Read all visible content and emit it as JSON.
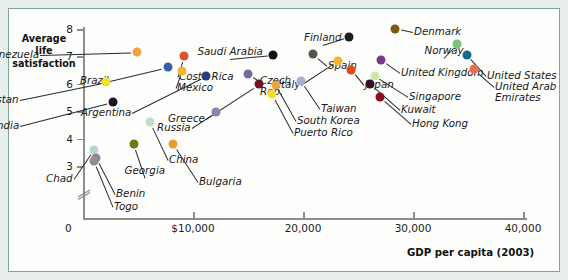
{
  "chart_data": {
    "type": "scatter",
    "title": "",
    "xlabel": "GDP per capita (2003)",
    "ylabel": "Average life satisfaction",
    "ylabel_lines": [
      "Average",
      "life",
      "satisfaction"
    ],
    "xlim": [
      0,
      45000
    ],
    "ylim": [
      2.6,
      8.3
    ],
    "grid": false,
    "legend": "none",
    "y_axis_break": true,
    "y_ticks": [
      {
        "value": 8,
        "label": "8"
      },
      {
        "value": 7,
        "label": "7"
      },
      {
        "value": 6,
        "label": "6"
      },
      {
        "value": 5,
        "label": "5"
      },
      {
        "value": 4,
        "label": "4"
      },
      {
        "value": 3,
        "label": "3"
      }
    ],
    "origin_label": "0",
    "x_ticks": [
      {
        "value": 10000,
        "label": "$10,000"
      },
      {
        "value": 20000,
        "label": "20,000"
      },
      {
        "value": 30000,
        "label": "30,000"
      },
      {
        "value": 40000,
        "label": "40,000"
      }
    ],
    "points": [
      {
        "name": "Venezuela",
        "x": 4900,
        "y": 7.15,
        "color": "#eda43c",
        "label": "Venezuela",
        "lx": 30,
        "ly": 40,
        "anchor": "end"
      },
      {
        "name": "Costa Rica",
        "x": 9200,
        "y": 7.0,
        "color": "#e0502a",
        "label": "Costa Rica",
        "lx": 170,
        "ly": 62,
        "anchor": "start"
      },
      {
        "name": "Brazil",
        "x": 7700,
        "y": 6.6,
        "color": "#3a5fa8",
        "label": "Brazil",
        "lx": 100,
        "ly": 66,
        "anchor": "end"
      },
      {
        "name": "Mexico",
        "x": 9000,
        "y": 6.47,
        "color": "#f0b62e",
        "label": "Mexico",
        "lx": 168,
        "ly": 73,
        "anchor": "start"
      },
      {
        "name": "Pakistan",
        "x": 2100,
        "y": 6.05,
        "color": "#f3dd2e",
        "label": "Pakistan",
        "lx": 10,
        "ly": 85,
        "anchor": "end"
      },
      {
        "name": "Argentina",
        "x": 11200,
        "y": 6.28,
        "color": "#2b3f7a",
        "label": "Argentina",
        "lx": 122,
        "ly": 98,
        "anchor": "end"
      },
      {
        "name": "India",
        "x": 2700,
        "y": 5.33,
        "color": "#241226",
        "label": "India",
        "lx": 10,
        "ly": 111,
        "anchor": "end"
      },
      {
        "name": "Saudi Arabia",
        "x": 17300,
        "y": 7.05,
        "color": "#111111",
        "label": "Saudi Arabia",
        "lx": 221,
        "ly": 37,
        "anchor": "center"
      },
      {
        "name": "Czech Rep.",
        "x": 15000,
        "y": 6.37,
        "color": "#6e6fa0",
        "label": "Czech\nRep.",
        "lx": 251,
        "ly": 66,
        "anchor": "start"
      },
      {
        "name": "Greece",
        "x": 16000,
        "y": 5.98,
        "color": "#70131f",
        "label": "Greece",
        "lx": 196,
        "ly": 104,
        "anchor": "end"
      },
      {
        "name": "Russia",
        "x": 12100,
        "y": 4.96,
        "color": "#8f82a5",
        "label": "Russia",
        "lx": 182,
        "ly": 113,
        "anchor": "end"
      },
      {
        "name": "Finland",
        "x": 24200,
        "y": 7.72,
        "color": "#1c1c1c",
        "label": "Finland",
        "lx": 314,
        "ly": 23,
        "anchor": "center"
      },
      {
        "name": "Denmark",
        "x": 28400,
        "y": 8.02,
        "color": "#7d5a11",
        "label": "Denmark",
        "lx": 405,
        "ly": 17,
        "anchor": "start"
      },
      {
        "name": "Spain",
        "x": 20900,
        "y": 7.08,
        "color": "#555550",
        "label": "Spain",
        "lx": 319,
        "ly": 51,
        "anchor": "start"
      },
      {
        "name": "Italy",
        "x": 23200,
        "y": 6.85,
        "color": "#f0b62e",
        "label": "Italy",
        "lx": 291,
        "ly": 70,
        "anchor": "end"
      },
      {
        "name": "Japan",
        "x": 24400,
        "y": 6.52,
        "color": "#e2481d",
        "label": "Japan",
        "lx": 356,
        "ly": 70,
        "anchor": "start"
      },
      {
        "name": "United Kingdom",
        "x": 27100,
        "y": 6.88,
        "color": "#7a3a8c",
        "label": "United Kingdom",
        "lx": 392,
        "ly": 58,
        "anchor": "start"
      },
      {
        "name": "Norway",
        "x": 34000,
        "y": 7.45,
        "color": "#7cc47d",
        "label": "Norway",
        "lx": 435,
        "ly": 36,
        "anchor": "center"
      },
      {
        "name": "United States",
        "x": 34900,
        "y": 7.06,
        "color": "#166b87",
        "label": "United States",
        "lx": 478,
        "ly": 61,
        "anchor": "start"
      },
      {
        "name": "United Arab Emirates",
        "x": 35500,
        "y": 6.54,
        "color": "#ea6e47",
        "label": "United Arab\nEmirates",
        "lx": 486,
        "ly": 72,
        "anchor": "start"
      },
      {
        "name": "Singapore",
        "x": 26500,
        "y": 6.3,
        "color": "#cfe6a8",
        "label": "Singapore",
        "lx": 400,
        "ly": 82,
        "anchor": "start"
      },
      {
        "name": "Kuwait",
        "x": 26100,
        "y": 6.0,
        "color": "#32102f",
        "label": "Kuwait",
        "lx": 392,
        "ly": 95,
        "anchor": "start"
      },
      {
        "name": "Hong Kong",
        "x": 27000,
        "y": 5.52,
        "color": "#8c1020",
        "label": "Hong Kong",
        "lx": 403,
        "ly": 109,
        "anchor": "start"
      },
      {
        "name": "Taiwan",
        "x": 19800,
        "y": 6.12,
        "color": "#b0aad0",
        "label": "Taiwan",
        "lx": 312,
        "ly": 94,
        "anchor": "start"
      },
      {
        "name": "South Korea",
        "x": 17500,
        "y": 5.96,
        "color": "#eda43c",
        "label": "South Korea",
        "lx": 288,
        "ly": 106,
        "anchor": "start"
      },
      {
        "name": "Puerto Rico",
        "x": 17200,
        "y": 5.62,
        "color": "#f3dd2e",
        "label": "Puerto Rico",
        "lx": 285,
        "ly": 118,
        "anchor": "start"
      },
      {
        "name": "China",
        "x": 6100,
        "y": 4.6,
        "color": "#c3dcc6",
        "label": "China",
        "lx": 160,
        "ly": 145,
        "anchor": "start"
      },
      {
        "name": "Georgia",
        "x": 4600,
        "y": 3.8,
        "color": "#697a15",
        "label": "Georgia",
        "lx": 136,
        "ly": 156,
        "anchor": "center"
      },
      {
        "name": "Bulgaria",
        "x": 8200,
        "y": 3.8,
        "color": "#ec9b2c",
        "label": "Bulgaria",
        "lx": 190,
        "ly": 167,
        "anchor": "start"
      },
      {
        "name": "Chad",
        "x": 1000,
        "y": 3.6,
        "color": "#b7d6ce",
        "label": "Chad",
        "lx": 64,
        "ly": 164,
        "anchor": "end"
      },
      {
        "name": "Benin",
        "x": 1200,
        "y": 3.3,
        "color": "#8e84a0",
        "label": "Benin",
        "lx": 107,
        "ly": 179,
        "anchor": "start"
      },
      {
        "name": "Togo",
        "x": 1000,
        "y": 3.18,
        "color": "#8f8f8f",
        "label": "Togo",
        "lx": 105,
        "ly": 192,
        "anchor": "start"
      }
    ]
  }
}
